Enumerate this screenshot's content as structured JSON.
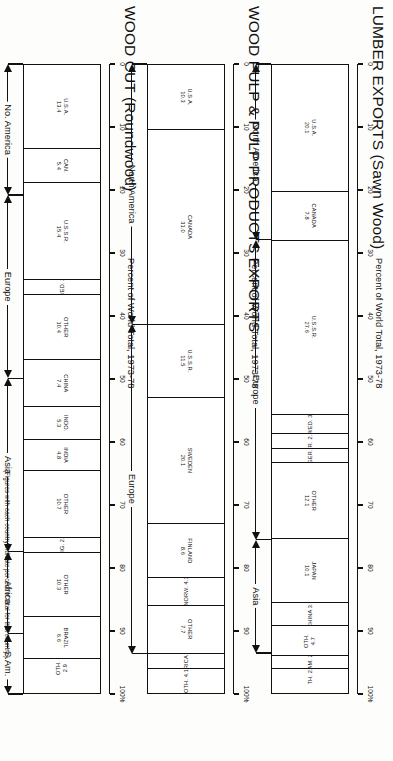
{
  "figure": {
    "footnote": "(Figures with each country indicate percent of total for that country.)",
    "axis_title": "Percent of World Total, 1973-78",
    "axis_ticks": [
      "0",
      "10",
      "20",
      "30",
      "40",
      "50",
      "60",
      "70",
      "80",
      "90",
      "100%"
    ]
  },
  "chart_data": [
    {
      "type": "bar",
      "orientation": "stacked-horizontal",
      "title": "LUMBER EXPORTS (Sawn Wood)",
      "xlabel": "Percent of World Total, 1973-78",
      "ylabel": "",
      "xlim": [
        0,
        100
      ],
      "grid": false,
      "legend": "none",
      "categories": [
        "U.S.A.",
        "CANADA",
        "U.S.S.R.",
        "SWED.",
        "FR.",
        "W.GER.",
        "OTHER",
        "JAPAN",
        "CHINA",
        "OTH.",
        "S.AM.",
        "OTH."
      ],
      "values": [
        20.1,
        7.8,
        27.6,
        3.1,
        2.3,
        2.3,
        12.1,
        10.1,
        3.7,
        4.7,
        2.1,
        2.4
      ],
      "labels": [
        "U.S.A.\n20.1",
        "CANADA\n7.8",
        "U.S.S.R.\n27.6",
        "SWED. 3.1",
        "FR. 2.3",
        "W.GER. 2.3",
        "OTHER\n12.1",
        "JAPAN\n10.1",
        "CHINA 3.7",
        "OTH.\n4.7",
        "S.AM. 2.1",
        "OTH. 2.4"
      ],
      "regions": [
        {
          "name": "North America",
          "start": 0,
          "end": 27.9
        },
        {
          "name": "Europe",
          "start": 27.9,
          "end": 75.5
        },
        {
          "name": "Asia",
          "start": 75.5,
          "end": 93.5
        }
      ]
    },
    {
      "type": "bar",
      "orientation": "stacked-horizontal",
      "title": "WOOD PULP & PULP PRODUCTS EXPORTS",
      "xlabel": "Percent of World Total, 1973-78",
      "ylabel": "",
      "xlim": [
        0,
        100
      ],
      "grid": false,
      "legend": "none",
      "categories": [
        "U.S.A.",
        "CANADA",
        "U.S.S.R.",
        "SWEDEN",
        "FINLAND",
        "NORW.",
        "OTHER",
        "AFRICA",
        "OTH."
      ],
      "values": [
        10.3,
        31.0,
        11.5,
        20.1,
        8.6,
        4.3,
        7.7,
        2.3,
        4.1
      ],
      "labels": [
        "U.S.A.\n10.3",
        "CANADA\n31.0",
        "U.S.S.R.\n11.5",
        "SWEDEN\n20.1",
        "FINLAND\n8.6",
        "NORW. 4.3",
        "OTHER\n7.7",
        "AFRICA 2.3",
        "OTH. 4.1"
      ],
      "regions": [
        {
          "name": "North America",
          "start": 0,
          "end": 41.3
        },
        {
          "name": "Europe",
          "start": 41.3,
          "end": 93.6
        }
      ]
    },
    {
      "type": "bar",
      "orientation": "stacked-horizontal",
      "title": "WOOD CUT (Roundwood)",
      "xlabel": "Percent of World Total, 1973-78",
      "ylabel": "",
      "xlim": [
        0,
        100
      ],
      "grid": false,
      "legend": "none",
      "categories": [
        "U.S.A.",
        "CAN.",
        "U.S.S.R.",
        "SWED.",
        "OTHER",
        "CHINA",
        "INDO.",
        "INDIA",
        "OTHER",
        "NIG.",
        "OTHER",
        "BRAZIL",
        "OTH."
      ],
      "values": [
        13.4,
        5.4,
        15.4,
        2.3,
        10.4,
        7.4,
        5.3,
        4.8,
        10.7,
        2.3,
        10.3,
        6.6,
        2.9
      ],
      "labels": [
        "U.S.A.\n13.4",
        "CAN.\n5.4",
        "U.S.S.R.\n15.4",
        "SWED. 2.3",
        "OTHER\n10.4",
        "CHINA\n7.4",
        "INDO.\n5.3",
        "INDIA\n4.8",
        "OTHER\n10.7",
        "NIG. 2.3",
        "OTHER\n10.3",
        "BRAZIL\n6.6",
        "OTH.\n2.9"
      ],
      "regions": [
        {
          "name": "No. America",
          "start": 0,
          "end": 20.8
        },
        {
          "name": "Europe",
          "start": 20.8,
          "end": 49.9
        },
        {
          "name": "Asia",
          "start": 49.9,
          "end": 77.4
        },
        {
          "name": "Africa",
          "start": 77.4,
          "end": 90.4
        },
        {
          "name": "S.Am.",
          "start": 90.4,
          "end": 100
        }
      ]
    }
  ]
}
